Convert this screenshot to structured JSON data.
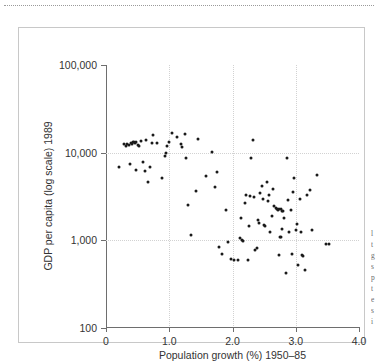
{
  "figure": {
    "background_color": "#ffffff",
    "frame_color": "#c8c8c8",
    "point_color": "#1a1a1a",
    "grid_color": "#d2d2d2",
    "axis_color": "#6e6e6e"
  },
  "margin_note": {
    "line1": "l",
    "line2": "t",
    "line3": "g",
    "line4": "s",
    "line5": "p",
    "line6": "t",
    "line7": "e",
    "line8": "s",
    "line9": "i"
  },
  "chart_data": {
    "type": "scatter",
    "title": "",
    "xlabel": "Population growth (%) 1950–85",
    "ylabel": "GDP per capita (log scale) 1989",
    "xlim": [
      0,
      4.0
    ],
    "ylim": [
      100,
      100000
    ],
    "yscale": "log",
    "xticks": [
      0,
      1.0,
      2.0,
      3.0,
      4.0
    ],
    "xticklabels": [
      "0",
      "1.0",
      "2.0",
      "3.0",
      "4.0"
    ],
    "yticks": [
      100,
      1000,
      10000,
      100000
    ],
    "yticklabels": [
      "100",
      "1,000",
      "10,000",
      "100,000"
    ],
    "grid": true,
    "grid_style": "dotted",
    "gridlines_x": [
      1.0,
      2.0,
      3.0
    ],
    "gridlines_y": [
      1000,
      10000
    ],
    "legend": null,
    "n_points": 111,
    "points": [
      [
        0.2,
        6900
      ],
      [
        0.28,
        12400
      ],
      [
        0.31,
        11800
      ],
      [
        0.33,
        12600
      ],
      [
        0.36,
        12200
      ],
      [
        0.39,
        13000
      ],
      [
        0.41,
        12700
      ],
      [
        0.43,
        13100
      ],
      [
        0.45,
        13400
      ],
      [
        0.46,
        12900
      ],
      [
        0.48,
        13200
      ],
      [
        0.5,
        12100
      ],
      [
        0.52,
        11900
      ],
      [
        0.55,
        13600
      ],
      [
        0.38,
        7500
      ],
      [
        0.47,
        6400
      ],
      [
        0.58,
        7900
      ],
      [
        0.62,
        6200
      ],
      [
        0.66,
        4600
      ],
      [
        0.7,
        6800
      ],
      [
        0.63,
        13900
      ],
      [
        0.72,
        13000
      ],
      [
        0.75,
        15800
      ],
      [
        0.8,
        12900
      ],
      [
        0.88,
        5200
      ],
      [
        0.93,
        9200
      ],
      [
        0.95,
        9800
      ],
      [
        0.97,
        11900
      ],
      [
        0.99,
        13300
      ],
      [
        1.05,
        16600
      ],
      [
        1.13,
        15100
      ],
      [
        1.18,
        12700
      ],
      [
        1.2,
        11600
      ],
      [
        1.25,
        16500
      ],
      [
        1.27,
        8800
      ],
      [
        1.3,
        2500
      ],
      [
        1.34,
        1150
      ],
      [
        1.42,
        3700
      ],
      [
        1.46,
        14200
      ],
      [
        1.58,
        5400
      ],
      [
        1.67,
        10200
      ],
      [
        1.72,
        4100
      ],
      [
        1.76,
        6000
      ],
      [
        1.78,
        830
      ],
      [
        1.84,
        700
      ],
      [
        1.9,
        2200
      ],
      [
        1.93,
        950
      ],
      [
        1.97,
        620
      ],
      [
        2.02,
        600
      ],
      [
        2.08,
        600
      ],
      [
        2.12,
        1050
      ],
      [
        2.15,
        1000
      ],
      [
        2.17,
        990
      ],
      [
        2.14,
        1800
      ],
      [
        2.2,
        2700
      ],
      [
        2.22,
        3300
      ],
      [
        2.24,
        600
      ],
      [
        2.26,
        1450
      ],
      [
        2.28,
        3200
      ],
      [
        2.3,
        8600
      ],
      [
        2.32,
        14000
      ],
      [
        2.34,
        3100
      ],
      [
        2.36,
        780
      ],
      [
        2.38,
        820
      ],
      [
        2.4,
        1700
      ],
      [
        2.42,
        1580
      ],
      [
        2.44,
        3500
      ],
      [
        2.46,
        4200
      ],
      [
        2.48,
        3000
      ],
      [
        2.5,
        1500
      ],
      [
        2.52,
        1450
      ],
      [
        2.54,
        4600
      ],
      [
        2.56,
        2800
      ],
      [
        2.58,
        3300
      ],
      [
        2.6,
        1250
      ],
      [
        2.62,
        1900
      ],
      [
        2.64,
        3900
      ],
      [
        2.66,
        2450
      ],
      [
        2.68,
        2350
      ],
      [
        2.7,
        2250
      ],
      [
        2.72,
        2200
      ],
      [
        2.74,
        2300
      ],
      [
        2.76,
        2250
      ],
      [
        2.78,
        2150
      ],
      [
        2.75,
        1100
      ],
      [
        2.77,
        1080
      ],
      [
        2.79,
        1350
      ],
      [
        2.73,
        680
      ],
      [
        2.8,
        2150
      ],
      [
        2.82,
        1800
      ],
      [
        2.84,
        420
      ],
      [
        2.86,
        8800
      ],
      [
        2.88,
        2900
      ],
      [
        2.9,
        1250
      ],
      [
        2.92,
        2200
      ],
      [
        2.94,
        700
      ],
      [
        2.96,
        3600
      ],
      [
        2.98,
        5200
      ],
      [
        3.0,
        1300
      ],
      [
        3.02,
        1550
      ],
      [
        3.04,
        520
      ],
      [
        3.06,
        3000
      ],
      [
        3.08,
        1250
      ],
      [
        3.1,
        680
      ],
      [
        3.12,
        660
      ],
      [
        3.14,
        460
      ],
      [
        3.18,
        3300
      ],
      [
        3.22,
        3800
      ],
      [
        3.26,
        1300
      ],
      [
        3.34,
        5600
      ],
      [
        3.48,
        900
      ],
      [
        3.52,
        900
      ]
    ]
  }
}
